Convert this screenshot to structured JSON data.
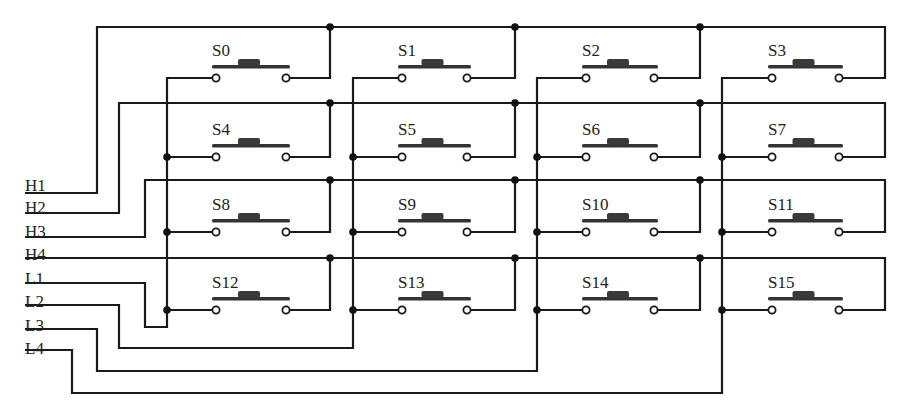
{
  "diagram": {
    "row_lines": [
      "H1",
      "H2",
      "H3",
      "H4"
    ],
    "column_lines": [
      "L1",
      "L2",
      "L3",
      "L4"
    ],
    "switches": [
      [
        "S0",
        "S1",
        "S2",
        "S3"
      ],
      [
        "S4",
        "S5",
        "S6",
        "S7"
      ],
      [
        "S8",
        "S9",
        "S10",
        "S11"
      ],
      [
        "S12",
        "S13",
        "S14",
        "S15"
      ]
    ],
    "colors": {
      "ink": "#1a1a1a",
      "background": "#ffffff"
    }
  }
}
